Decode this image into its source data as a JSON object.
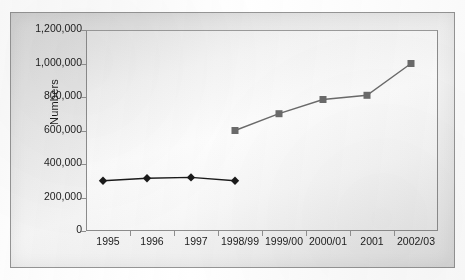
{
  "chart_data": {
    "type": "line",
    "title": "",
    "xlabel": "",
    "ylabel": "Numbers",
    "categories": [
      "1995",
      "1996",
      "1997",
      "1998/99",
      "1999/00",
      "2000/01",
      "2001",
      "2002/03"
    ],
    "ylim": [
      0,
      1200000
    ],
    "ytick_values": [
      0,
      200000,
      400000,
      600000,
      800000,
      1000000,
      1200000
    ],
    "ytick_labels": [
      "0",
      "200,000",
      "400,000",
      "600,000",
      "800,000",
      "1,000,000",
      "1,200,000"
    ],
    "grid": false,
    "legend": "none",
    "series": [
      {
        "name": "series-1",
        "marker": "diamond",
        "color": "#1a1a1a",
        "points": [
          {
            "category": "1995",
            "value": 300000
          },
          {
            "category": "1996",
            "value": 315000
          },
          {
            "category": "1997",
            "value": 320000
          },
          {
            "category": "1998/99",
            "value": 300000
          }
        ]
      },
      {
        "name": "series-2",
        "marker": "square",
        "color": "#6b6b6b",
        "points": [
          {
            "category": "1998/99",
            "value": 600000
          },
          {
            "category": "1999/00",
            "value": 700000
          },
          {
            "category": "2000/01",
            "value": 785000
          },
          {
            "category": "2001",
            "value": 810000
          },
          {
            "category": "2002/03",
            "value": 1000000
          }
        ]
      }
    ]
  },
  "colors": {
    "plot_border": "#8d8d8d",
    "frame_border": "#9a9a9a",
    "text": "#1c1c1c",
    "series1": "#1a1a1a",
    "series2": "#6b6b6b"
  }
}
